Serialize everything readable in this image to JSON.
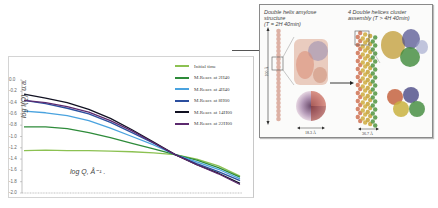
{
  "chart_data": {
    "type": "line",
    "title": "",
    "xlabel": "log Q, Å⁻¹",
    "ylabel": "log I(Q), u.a.",
    "ylim": [
      -2.0,
      0.0
    ],
    "yticks": [
      "0.0",
      "-0.2",
      "-0.4",
      "-0.6",
      "-0.8",
      "-1.0",
      "-1.2",
      "-1.4",
      "-1.6",
      "-1.8",
      "-2.0"
    ],
    "x": [
      0,
      0.1,
      0.2,
      0.3,
      0.4,
      0.5,
      0.6,
      0.7,
      0.8,
      0.9,
      1.0
    ],
    "grid": false,
    "legend_position": "upper right",
    "series": [
      {
        "name": "Initial time",
        "color": "#8cc152",
        "values": [
          -1.25,
          -1.24,
          -1.25,
          -1.25,
          -1.26,
          -1.27,
          -1.29,
          -1.32,
          -1.4,
          -1.52,
          -1.7
        ]
      },
      {
        "name": "M.Reacr. at 2H40",
        "color": "#2e8b3a",
        "values": [
          -0.83,
          -0.83,
          -0.86,
          -0.93,
          -1.02,
          -1.12,
          -1.22,
          -1.32,
          -1.42,
          -1.55,
          -1.72
        ]
      },
      {
        "name": "M.Reacr. at 4H40",
        "color": "#4aa3df",
        "values": [
          -0.55,
          -0.58,
          -0.63,
          -0.72,
          -0.85,
          -1.0,
          -1.15,
          -1.32,
          -1.45,
          -1.58,
          -1.75
        ]
      },
      {
        "name": "M.Reacr. at 8H00",
        "color": "#2b4e9e",
        "values": [
          -0.36,
          -0.42,
          -0.5,
          -0.6,
          -0.75,
          -0.93,
          -1.12,
          -1.32,
          -1.48,
          -1.62,
          -1.78
        ]
      },
      {
        "name": "M.Reacr. at 14H00",
        "color": "#111122",
        "values": [
          -0.25,
          -0.32,
          -0.4,
          -0.52,
          -0.68,
          -0.88,
          -1.1,
          -1.32,
          -1.5,
          -1.65,
          -1.83
        ]
      },
      {
        "name": "M.Reacr. at 22H00",
        "color": "#5c2a6e",
        "values": [
          -0.36,
          -0.4,
          -0.47,
          -0.57,
          -0.72,
          -0.9,
          -1.11,
          -1.32,
          -1.5,
          -1.66,
          -1.85
        ]
      }
    ]
  },
  "chart": {
    "xlabel": "log Q,  Å⁻¹ .",
    "ylabel": "log I(Q),  u.a."
  },
  "panel": {
    "left_title_line1": "Double helix amylose",
    "left_title_line2": "structure",
    "left_title_line3": "(T = 2H 40min)",
    "right_title_line1": "4 Double helices cluster",
    "right_title_line2": "assembly (T > 4H 40min)",
    "length_label": "100 Å",
    "left_scale": "18.3 Å",
    "right_scale": "36.7 Å"
  }
}
